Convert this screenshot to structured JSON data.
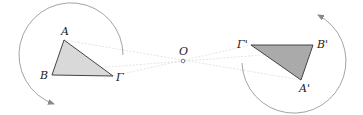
{
  "diagram": {
    "center": {
      "label": "O",
      "x": 183,
      "y": 61
    },
    "original_triangle": {
      "fill": "#d9d9d9",
      "stroke": "#444444",
      "vertices": [
        {
          "label": "A",
          "x": 64,
          "y": 40,
          "lx": 61,
          "ly": 35
        },
        {
          "label": "B",
          "x": 52,
          "y": 75,
          "lx": 40,
          "ly": 79
        },
        {
          "label": "Γ",
          "x": 113,
          "y": 76,
          "lx": 116,
          "ly": 81
        }
      ]
    },
    "image_triangle": {
      "fill": "#aaaaaa",
      "stroke": "#444444",
      "vertices": [
        {
          "label": "Γ'",
          "x": 251,
          "y": 45,
          "lx": 238,
          "ly": 45
        },
        {
          "label": "B'",
          "x": 313,
          "y": 45,
          "lx": 317,
          "ly": 48
        },
        {
          "label": "A'",
          "x": 301,
          "y": 80,
          "lx": 299,
          "ly": 92
        }
      ]
    },
    "rotation_arrows": [
      {
        "name": "left-rotation-arc",
        "color": "#888888"
      },
      {
        "name": "right-rotation-arc",
        "color": "#888888"
      }
    ],
    "guide_line_color": "#dddddd"
  }
}
